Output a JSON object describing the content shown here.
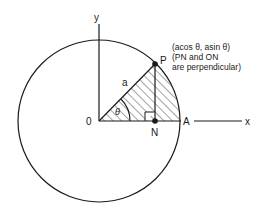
{
  "diagram": {
    "labels": {
      "y_axis": "y",
      "x_axis": "x",
      "origin": "0",
      "point_p": "P",
      "point_n": "N",
      "point_a": "A",
      "radius": "a",
      "angle": "θ"
    },
    "annotation": {
      "line1": "(acos θ, asin θ)",
      "line2": "(PN and ON",
      "line3": "are perpendicular)"
    },
    "colors": {
      "stroke": "#1a1a1a",
      "background": "#ffffff"
    }
  }
}
